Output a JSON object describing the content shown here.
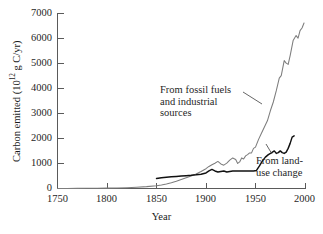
{
  "chart_data": {
    "type": "line",
    "title": "",
    "xlabel": "Year",
    "ylabel": "Carbon emitted (10^12 g C/yr)",
    "ylabel_prefix": "Carbon emitted (10",
    "ylabel_exponent": "12",
    "ylabel_suffix": " g C/yr)",
    "xlim": [
      1750,
      2000
    ],
    "ylim": [
      0,
      7000
    ],
    "grid": false,
    "legend": "annotations-inline",
    "xticks": [
      1750,
      1800,
      1850,
      1900,
      1950,
      2000
    ],
    "xtick_labels": [
      "1750",
      "1800",
      "1850",
      "1900",
      "1950",
      "2000"
    ],
    "yticks": [
      0,
      1000,
      2000,
      3000,
      4000,
      5000,
      6000,
      7000
    ],
    "ytick_labels": [
      "0",
      "1000",
      "2000",
      "3000",
      "4000",
      "5000",
      "6000",
      "7000"
    ],
    "series": [
      {
        "name": "From fossil fuels and industrial sources",
        "color": "#7d7d7d",
        "x": [
          1750,
          1760,
          1770,
          1780,
          1790,
          1800,
          1810,
          1820,
          1830,
          1840,
          1850,
          1855,
          1860,
          1865,
          1870,
          1875,
          1880,
          1885,
          1890,
          1895,
          1900,
          1903,
          1906,
          1909,
          1912,
          1915,
          1918,
          1921,
          1924,
          1927,
          1930,
          1932,
          1934,
          1936,
          1938,
          1940,
          1942,
          1944,
          1946,
          1948,
          1950,
          1953,
          1956,
          1959,
          1962,
          1965,
          1968,
          1971,
          1974,
          1976,
          1979,
          1981,
          1983,
          1985,
          1988,
          1991,
          1993,
          1995,
          1997,
          1999
        ],
        "values": [
          3,
          4,
          6,
          8,
          11,
          15,
          22,
          32,
          50,
          75,
          110,
          140,
          180,
          230,
          290,
          360,
          430,
          500,
          580,
          680,
          790,
          880,
          950,
          1010,
          1080,
          980,
          930,
          1010,
          1130,
          1220,
          1160,
          1000,
          1060,
          1220,
          1180,
          1300,
          1350,
          1420,
          1420,
          1600,
          1650,
          1950,
          2200,
          2450,
          2700,
          3100,
          3450,
          3900,
          4400,
          4500,
          5100,
          5000,
          4950,
          5300,
          5900,
          6100,
          6000,
          6300,
          6400,
          6600
        ],
        "units": "10^12 g C/yr"
      },
      {
        "name": "From land-use change",
        "color": "#111111",
        "x": [
          1850,
          1855,
          1860,
          1865,
          1870,
          1875,
          1880,
          1885,
          1890,
          1895,
          1900,
          1903,
          1906,
          1909,
          1912,
          1915,
          1918,
          1921,
          1924,
          1927,
          1930,
          1933,
          1936,
          1939,
          1942,
          1945,
          1948,
          1951,
          1954,
          1957,
          1960,
          1963,
          1966,
          1969,
          1971,
          1973,
          1975,
          1977,
          1979,
          1981,
          1983,
          1985,
          1987,
          1989
        ],
        "values": [
          400,
          430,
          450,
          465,
          480,
          495,
          510,
          525,
          545,
          570,
          620,
          700,
          760,
          700,
          660,
          680,
          700,
          660,
          680,
          700,
          700,
          700,
          700,
          700,
          700,
          700,
          700,
          720,
          900,
          1100,
          1250,
          1350,
          1420,
          1500,
          1400,
          1430,
          1500,
          1430,
          1400,
          1450,
          1600,
          1800,
          2050,
          2100
        ],
        "units": "10^12 g C/yr"
      }
    ],
    "annotations": [
      {
        "id": "fossil",
        "lines": [
          "From fossil fuels",
          "and industrial",
          "sources"
        ],
        "points_to_series": "From fossil fuels and industrial sources"
      },
      {
        "id": "landuse",
        "lines": [
          "From land-",
          "use change"
        ],
        "points_to_series": "From land-use change"
      }
    ]
  }
}
